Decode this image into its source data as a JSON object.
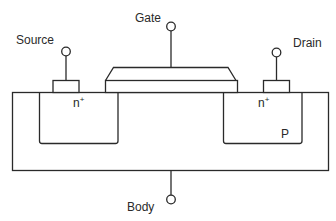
{
  "diagram": {
    "type": "nmos-transistor-cross-section",
    "terminals": {
      "source": {
        "label": "Source"
      },
      "gate": {
        "label": "Gate"
      },
      "drain": {
        "label": "Drain"
      },
      "body": {
        "label": "Body"
      }
    },
    "regions": {
      "source_well": {
        "label": "n",
        "doping": "+"
      },
      "drain_well": {
        "label": "n",
        "doping": "+"
      },
      "substrate": {
        "label": "P"
      }
    },
    "colors": {
      "stroke": "#2a2a2a",
      "background": "#ffffff"
    }
  }
}
